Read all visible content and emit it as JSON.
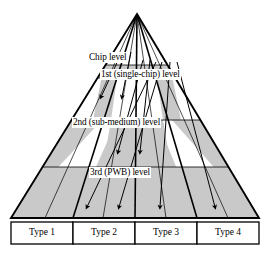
{
  "figure": {
    "kind": "pyramid-hierarchy-diagram",
    "shape": "triangle",
    "apex": {
      "x": 137,
      "y": 14
    },
    "base": {
      "left_x": 11,
      "right_x": 259,
      "y": 218
    },
    "fill_colors": {
      "band_shaded": "#c9c9c9",
      "band_plain": "#ffffff",
      "stroke": "#000000",
      "label_bg": "#ffffff"
    }
  },
  "levels": [
    {
      "id": "chip",
      "label": "Chip level",
      "x": 88,
      "y": 57
    },
    {
      "id": "first",
      "label": "1st (single-chip) level",
      "x": 100,
      "y": 74
    },
    {
      "id": "second",
      "label": "2nd (sub-medium) level",
      "x": 72,
      "y": 122
    },
    {
      "id": "third",
      "label": "3rd (PWB) level",
      "x": 89,
      "y": 172
    }
  ],
  "bands": [
    {
      "id": "band-chip",
      "shaded": true,
      "top_y": 65,
      "bottom_y": 78
    },
    {
      "id": "band-first",
      "shaded": false,
      "top_y": 78,
      "bottom_y": 120
    },
    {
      "id": "band-second",
      "shaded": true,
      "top_y": 120,
      "bottom_y": 167
    },
    {
      "id": "band-third",
      "shaded": false,
      "top_y": 167,
      "bottom_y": 167
    },
    {
      "id": "band-pwb",
      "shaded": true,
      "top_y": 167,
      "bottom_y": 218
    }
  ],
  "types": [
    {
      "id": "type-1",
      "label": "Type 1",
      "cell": {
        "x": 11,
        "y": 222,
        "w": 62,
        "h": 22
      }
    },
    {
      "id": "type-2",
      "label": "Type 2",
      "cell": {
        "x": 73,
        "y": 222,
        "w": 62,
        "h": 22
      }
    },
    {
      "id": "type-3",
      "label": "Type 3",
      "cell": {
        "x": 135,
        "y": 222,
        "w": 62,
        "h": 22
      }
    },
    {
      "id": "type-4",
      "label": "Type 4",
      "cell": {
        "x": 197,
        "y": 222,
        "w": 62,
        "h": 22
      }
    }
  ],
  "flow_arrows": [
    {
      "id": "arrow-type1-chip",
      "from_level": "chip",
      "to_type": "type-1"
    },
    {
      "id": "arrow-type2-chip",
      "from_level": "chip",
      "to_type": "type-2"
    },
    {
      "id": "arrow-type2-second",
      "from_level": "first",
      "to_type": "type-2"
    },
    {
      "id": "arrow-type3-second",
      "from_level": "first",
      "to_type": "type-3"
    },
    {
      "id": "arrow-type3-pwb",
      "from_level": "second",
      "to_type": "type-3"
    },
    {
      "id": "arrow-type4-pwb",
      "from_level": "second",
      "to_type": "type-4"
    }
  ]
}
